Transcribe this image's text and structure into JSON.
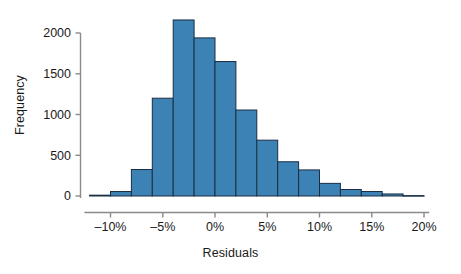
{
  "chart_data": {
    "type": "bar",
    "title": "",
    "subtitle": "",
    "xlabel": "Residuals",
    "ylabel": "Frequency",
    "grid": false,
    "legend": "none",
    "bin_width_percent": 2,
    "xlim": [
      -12.5,
      20.5
    ],
    "ylim": [
      0,
      2200
    ],
    "xticks": [
      -10,
      -5,
      0,
      5,
      10,
      15,
      20
    ],
    "xtick_labels": [
      "–10%",
      "–5%",
      "0%",
      "5%",
      "10%",
      "15%",
      "20%"
    ],
    "yticks": [
      0,
      500,
      1000,
      1500,
      2000
    ],
    "ytick_labels": [
      "0",
      "500",
      "1000",
      "1500",
      "2000"
    ],
    "bin_edges": [
      -12,
      -10,
      -8,
      -6,
      -4,
      -3,
      -1,
      1,
      3,
      5,
      7,
      9,
      11,
      13,
      15,
      17,
      18
    ],
    "bins": [
      {
        "left": -12,
        "right": -10,
        "center": -11,
        "value": 10
      },
      {
        "left": -10,
        "right": -8,
        "center": -9,
        "value": 55
      },
      {
        "left": -8,
        "right": -6,
        "center": -7,
        "value": 325
      },
      {
        "left": -6,
        "right": -4,
        "center": -5,
        "value": 1200
      },
      {
        "left": -4,
        "right": -2,
        "center": -3,
        "value": 2160
      },
      {
        "left": -2,
        "right": 0,
        "center": -1,
        "value": 1940
      },
      {
        "left": 0,
        "right": 2,
        "center": 1,
        "value": 1650
      },
      {
        "left": 2,
        "right": 4,
        "center": 3,
        "value": 1055
      },
      {
        "left": 4,
        "right": 6,
        "center": 5,
        "value": 685
      },
      {
        "left": 6,
        "right": 8,
        "center": 7,
        "value": 420
      },
      {
        "left": 8,
        "right": 10,
        "center": 9,
        "value": 320
      },
      {
        "left": 10,
        "right": 12,
        "center": 11,
        "value": 155
      },
      {
        "left": 12,
        "right": 14,
        "center": 13,
        "value": 80
      },
      {
        "left": 14,
        "right": 16,
        "center": 15,
        "value": 55
      },
      {
        "left": 16,
        "right": 18,
        "center": 17,
        "value": 25
      },
      {
        "left": 18,
        "right": 20,
        "center": 19,
        "value": 5
      }
    ],
    "categories": [
      "-11%",
      "-9%",
      "-7%",
      "-5%",
      "-3%",
      "-1%",
      "1%",
      "3%",
      "5%",
      "7%",
      "9%",
      "11%",
      "13%",
      "15%",
      "17%",
      "19%"
    ],
    "values": [
      10,
      55,
      325,
      1200,
      2160,
      1940,
      1650,
      1055,
      685,
      420,
      320,
      155,
      80,
      55,
      25,
      5
    ],
    "colors": {
      "bar_fill": "#3d82b5",
      "bar_edge": "#1b2f43",
      "axis": "#8a8a8a",
      "text": "#1a1a1a",
      "background": "#ffffff"
    }
  }
}
